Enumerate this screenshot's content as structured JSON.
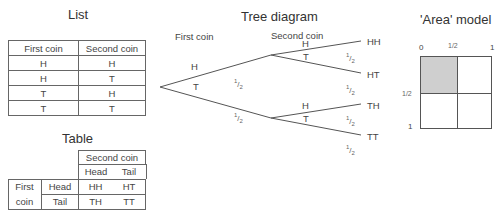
{
  "list": {
    "title": "List",
    "headers": [
      "First coin",
      "Second coin"
    ],
    "rows": [
      [
        "H",
        "H"
      ],
      [
        "H",
        "T"
      ],
      [
        "T",
        "H"
      ],
      [
        "T",
        "T"
      ]
    ]
  },
  "table": {
    "title": "Table",
    "col_group": "Second coin",
    "col_headers": [
      "Head",
      "Tail"
    ],
    "row_group": [
      "First",
      "coin"
    ],
    "row_headers": [
      "Head",
      "Tail"
    ],
    "cells": [
      [
        "HH",
        "HT"
      ],
      [
        "TH",
        "TT"
      ]
    ]
  },
  "tree": {
    "title": "Tree diagram",
    "stage1_label": "First coin",
    "stage2_label": "Second coin",
    "branch1": [
      "H",
      "T"
    ],
    "branch2_upper": [
      "H",
      "T"
    ],
    "branch2_lower": [
      "H",
      "T"
    ],
    "outcomes": [
      "HH",
      "HT",
      "TH",
      "TT"
    ],
    "prob_num": "1",
    "prob_den": "2"
  },
  "area": {
    "title": "'Area' model",
    "x_ticks": [
      "0",
      "1/2",
      "1"
    ],
    "y_ticks": [
      "1/2",
      "1"
    ],
    "shaded_color": "#cfcfcf"
  }
}
